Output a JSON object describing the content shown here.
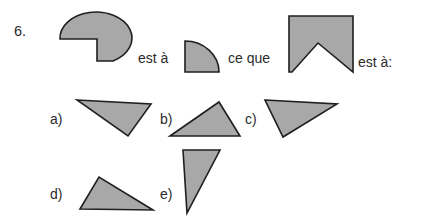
{
  "page": {
    "background_color": "#ffffff",
    "width": 422,
    "height": 221
  },
  "question": {
    "number": "6.",
    "connector_1": "est à",
    "connector_2": "ce que",
    "connector_3": "est à:"
  },
  "style": {
    "shape_fill": "#a8a8a8",
    "shape_stroke": "#1f1f1f",
    "text_color": "#2b2b2b"
  },
  "prompt_shapes": [
    {
      "id": "shape-pacman-ellipse",
      "name": "ellipse-with-quarter-wedge-removed",
      "description": "Large ellipse with a quarter wedge cut out of the lower-left",
      "path": "M 60 39 A 36 26 0 1 1 113 61 L 97 61 L 97 39 Z"
    },
    {
      "id": "shape-quarter-circle",
      "name": "quarter-circle",
      "description": "Quarter disc with flat left and bottom edges and convex arc",
      "path": "M 185 41 L 185 72 L 219 72 A 34 31 0 0 0 185 41 Z"
    },
    {
      "id": "shape-notched-rectangle",
      "name": "rectangle-with-v-notch",
      "description": "Rectangle with a large V notch removed from the bottom edge",
      "path": "M 289 16 L 353 16 L 353 72 L 318 43 L 292 72 L 289 72 Z"
    }
  ],
  "options": [
    {
      "label": "a)",
      "id": "option-a",
      "shape_name": "triangle-a",
      "path": "M 77 100 L 151 104 L 128 136 Z"
    },
    {
      "label": "b)",
      "id": "option-b",
      "shape_name": "triangle-b",
      "path": "M 170 136 L 219 102 L 240 136 Z"
    },
    {
      "label": "c)",
      "id": "option-c",
      "shape_name": "triangle-c",
      "path": "M 265 100 L 337 104 L 283 137 Z"
    },
    {
      "label": "d)",
      "id": "option-d",
      "shape_name": "triangle-d",
      "path": "M 80 209 L 99 177 L 153 210 Z"
    },
    {
      "label": "e)",
      "id": "option-e",
      "shape_name": "triangle-e",
      "path": "M 183 150 L 220 150 L 187 213 Z"
    }
  ]
}
